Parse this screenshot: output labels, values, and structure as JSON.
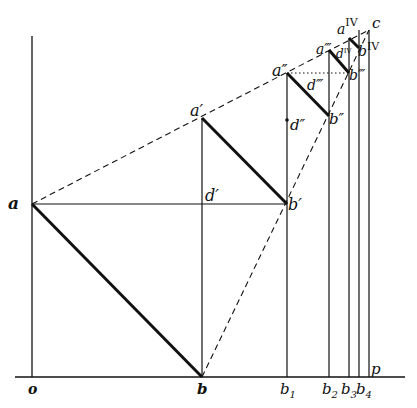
{
  "diagram": {
    "title": "",
    "type": "geometric construction",
    "colors": {
      "line": "#111111",
      "background": "#ffffff"
    },
    "points": {
      "o": {
        "label": "o",
        "x": 32,
        "y": 377
      },
      "b": {
        "label": "b",
        "x": 202,
        "y": 377
      },
      "b1": {
        "label": "b",
        "sub": "1",
        "x": 287,
        "y": 377
      },
      "b2": {
        "label": "b",
        "sub": "2",
        "x": 329,
        "y": 377
      },
      "b3": {
        "label": "b",
        "sub": "3",
        "x": 349,
        "y": 377
      },
      "b4": {
        "label": "b",
        "sub": "4",
        "x": 359,
        "y": 377
      },
      "p": {
        "label": "p",
        "x": 369,
        "y": 377
      },
      "a": {
        "label": "a",
        "x": 32,
        "y": 204
      },
      "a1": {
        "label": "a′",
        "x": 202,
        "y": 118
      },
      "d1": {
        "label": "d′",
        "x": 202,
        "y": 204
      },
      "bp1": {
        "label": "b′",
        "x": 287,
        "y": 204
      },
      "a2": {
        "label": "a″",
        "x": 287,
        "y": 73
      },
      "d2": {
        "label": "d″",
        "x": 287,
        "y": 120
      },
      "bp2": {
        "label": "b″",
        "x": 329,
        "y": 116
      },
      "d3": {
        "label": "d‴",
        "x": 300,
        "y": 86
      },
      "a3": {
        "label": "a‴",
        "x": 329,
        "y": 50
      },
      "bp3": {
        "label": "b‴",
        "x": 349,
        "y": 73
      },
      "d4": {
        "label": "d",
        "sup": "IV",
        "x": 340,
        "y": 58
      },
      "a4": {
        "label": "a",
        "sup": "IV",
        "x": 349,
        "y": 38
      },
      "bp4": {
        "label": "b",
        "sup": "IV",
        "x": 359,
        "y": 48
      },
      "c": {
        "label": "c",
        "x": 369,
        "y": 30
      }
    },
    "labels": {
      "o": "o",
      "b": "b",
      "b_base": "b",
      "s1": "1",
      "s2": "2",
      "s3": "3",
      "s4": "4",
      "p": "p",
      "a": "a",
      "a1": "a′",
      "d1": "d′",
      "bp1": "b′",
      "a2": "a″",
      "d2": "d″",
      "bp2": "b″",
      "a3": "a‴",
      "d3": "d‴",
      "bp3": "b‴",
      "a4": "a",
      "d4": "d",
      "bp4": "b",
      "iv": "IV",
      "c": "c"
    }
  }
}
